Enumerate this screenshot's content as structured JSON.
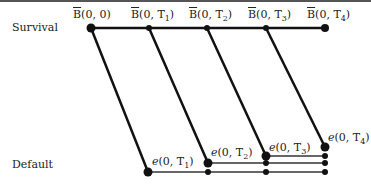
{
  "diagram": {
    "row_labels": {
      "survival": "Survival",
      "default": "Default"
    },
    "survival_nodes": [
      {
        "label": "B(0,0)",
        "x": 91,
        "y": 28
      },
      {
        "label": "B(0,T1)",
        "x": 149,
        "y": 28
      },
      {
        "label": "B(0,T2)",
        "x": 207,
        "y": 28
      },
      {
        "label": "B(0,T3)",
        "x": 266,
        "y": 28
      },
      {
        "label": "B(0,T4)",
        "x": 325,
        "y": 28
      }
    ],
    "default_nodes": [
      {
        "label": "e(0,T1)",
        "x": 148,
        "y": 172
      },
      {
        "label": "e(0,T2)",
        "x": 208,
        "y": 163
      },
      {
        "label": "e(0,T3)",
        "x": 266,
        "y": 156
      },
      {
        "label": "e(0,T4)",
        "x": 325,
        "y": 147
      }
    ],
    "colors": {
      "line": "#111111",
      "node": "#111111"
    }
  }
}
